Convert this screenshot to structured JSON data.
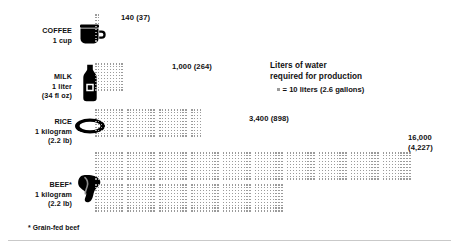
{
  "chart_data": {
    "type": "bar",
    "title": "Liters of water required for production",
    "xlabel": "",
    "ylabel": "",
    "unit_note": "= 10 liters (2.6 gallons)",
    "dot_value_liters": 10,
    "categories": [
      "COFFEE",
      "MILK",
      "RICE",
      "BEEF*"
    ],
    "values": [
      140,
      1000,
      3400,
      16000
    ],
    "values_gallons": [
      37,
      264,
      898,
      4227
    ],
    "value_labels": [
      "140 (37)",
      "1,000 (264)",
      "3,400 (898)",
      "16,000 (4,227)"
    ],
    "series": [
      {
        "name": "Liters of water required for production",
        "values": [
          140,
          1000,
          3400,
          16000
        ]
      }
    ],
    "legend_position": "center-right",
    "grid": false,
    "footnote": "* Grain-fed beef"
  },
  "rows": [
    {
      "name": "COFFEE",
      "amount": "1 cup",
      "sub": "",
      "icon": "coffee-mug-icon",
      "liters": 140,
      "gallons": 37,
      "value_label": "140 (37)",
      "dots": 14,
      "block_rows": 10,
      "block_cols": 10
    },
    {
      "name": "MILK",
      "amount": "1 liter",
      "sub": "(34 fl oz)",
      "icon": "milk-bottle-icon",
      "liters": 1000,
      "gallons": 264,
      "value_label": "1,000 (264)",
      "dots": 100,
      "block_rows": 10,
      "block_cols": 10
    },
    {
      "name": "RICE",
      "amount": "1 kilogram",
      "sub": "(2.2 lb)",
      "icon": "rice-bowl-icon",
      "liters": 3400,
      "gallons": 898,
      "value_label": "3,400 (898)",
      "dots": 340,
      "block_rows": 10,
      "block_cols": 10
    },
    {
      "name": "BEEF*",
      "amount": "1 kilogram",
      "sub": "(2.2 lb)",
      "icon": "beef-steak-icon",
      "liters": 16000,
      "gallons": 4227,
      "value_label_line1": "16,000",
      "value_label_line2": "(4,227)",
      "value_label": "16,000 (4,227)",
      "dots": 1600,
      "block_rows": 10,
      "block_cols": 10
    }
  ],
  "legend": {
    "title_line1": "Liters of water",
    "title_line2": "required for production",
    "key": "= 10 liters (2.6 gallons)"
  },
  "footnote": "* Grain-fed beef",
  "colors": {
    "dot": "#9b9b9b",
    "text": "#111111",
    "icon": "#000000",
    "background": "#ffffff",
    "rule": "#c9c9c9"
  }
}
